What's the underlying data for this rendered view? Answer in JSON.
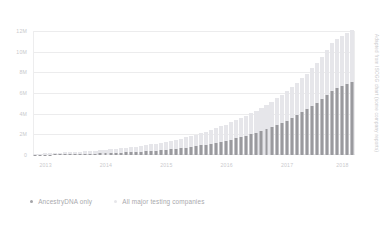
{
  "chart_data": {
    "type": "bar",
    "title": "",
    "subtitle": "",
    "xlabel": "",
    "ylabel": "",
    "ylim": [
      0,
      12000000
    ],
    "yticks": [
      0,
      2000000,
      4000000,
      6000000,
      8000000,
      10000000,
      12000000
    ],
    "ytick_labels": [
      "0",
      "2M",
      "4M",
      "6M",
      "8M",
      "10M",
      "12M"
    ],
    "grid": true,
    "legend_position": "bottom-left",
    "annotation": "Adapted from ISOGG chart (some company reports)",
    "xtick_labels": [
      "2013",
      "2014",
      "2015",
      "2016",
      "2017",
      "2018"
    ],
    "xtick_positions": [
      2,
      14,
      26,
      38,
      50,
      61
    ],
    "x": [
      "2013-01",
      "2013-02",
      "2013-03",
      "2013-04",
      "2013-05",
      "2013-06",
      "2013-07",
      "2013-08",
      "2013-09",
      "2013-10",
      "2013-11",
      "2013-12",
      "2014-01",
      "2014-02",
      "2014-03",
      "2014-04",
      "2014-05",
      "2014-06",
      "2014-07",
      "2014-08",
      "2014-09",
      "2014-10",
      "2014-11",
      "2014-12",
      "2015-01",
      "2015-02",
      "2015-03",
      "2015-04",
      "2015-05",
      "2015-06",
      "2015-07",
      "2015-08",
      "2015-09",
      "2015-10",
      "2015-11",
      "2015-12",
      "2016-01",
      "2016-02",
      "2016-03",
      "2016-04",
      "2016-05",
      "2016-06",
      "2016-07",
      "2016-08",
      "2016-09",
      "2016-10",
      "2016-11",
      "2016-12",
      "2017-01",
      "2017-02",
      "2017-03",
      "2017-04",
      "2017-05",
      "2017-06",
      "2017-07",
      "2017-08",
      "2017-09",
      "2017-10",
      "2017-11",
      "2017-12",
      "2018-01",
      "2018-02",
      "2018-03",
      "2018-04"
    ],
    "series": [
      {
        "name": "All major testing companies",
        "color": "#e6e6ea",
        "values": [
          120000,
          140000,
          160000,
          180000,
          200000,
          225000,
          250000,
          275000,
          300000,
          330000,
          360000,
          395000,
          430000,
          470000,
          510000,
          555000,
          600000,
          650000,
          700000,
          755000,
          815000,
          880000,
          950000,
          1030000,
          1110000,
          1195000,
          1285000,
          1380000,
          1480000,
          1590000,
          1705000,
          1830000,
          1960000,
          2100000,
          2250000,
          2410000,
          2580000,
          2760000,
          2950000,
          3150000,
          3360000,
          3580000,
          3810000,
          4050000,
          4300000,
          4570000,
          4850000,
          5150000,
          5470000,
          5810000,
          6170000,
          6560000,
          6970000,
          7410000,
          7880000,
          8390000,
          8930000,
          9510000,
          10130000,
          10800000,
          11200000,
          11500000,
          11800000,
          12050000
        ]
      },
      {
        "name": "AncestryDNA only",
        "color": "#9a9a9e",
        "values": [
          30000,
          35000,
          40000,
          45000,
          52000,
          60000,
          68000,
          77000,
          87000,
          98000,
          110000,
          123000,
          137000,
          152000,
          168000,
          186000,
          205000,
          226000,
          249000,
          274000,
          301000,
          330000,
          362000,
          396000,
          433000,
          473000,
          516000,
          562000,
          612000,
          666000,
          724000,
          786000,
          853000,
          925000,
          1002000,
          1085000,
          1174000,
          1270000,
          1372000,
          1482000,
          1600000,
          1726000,
          1861000,
          2005000,
          2160000,
          2325000,
          2502000,
          2690000,
          2890000,
          3105000,
          3335000,
          3580000,
          3842000,
          4120000,
          4420000,
          4740000,
          5080000,
          5440000,
          5830000,
          6240000,
          6480000,
          6700000,
          6900000,
          7050000
        ]
      }
    ]
  },
  "legend": {
    "items": [
      {
        "label": "AncestryDNA only",
        "marker": "dot-dark"
      },
      {
        "label": "All major testing companies",
        "marker": "dot-light"
      }
    ]
  },
  "credit": {
    "text": "Adapted from ISOGG chart (some company reports)"
  }
}
